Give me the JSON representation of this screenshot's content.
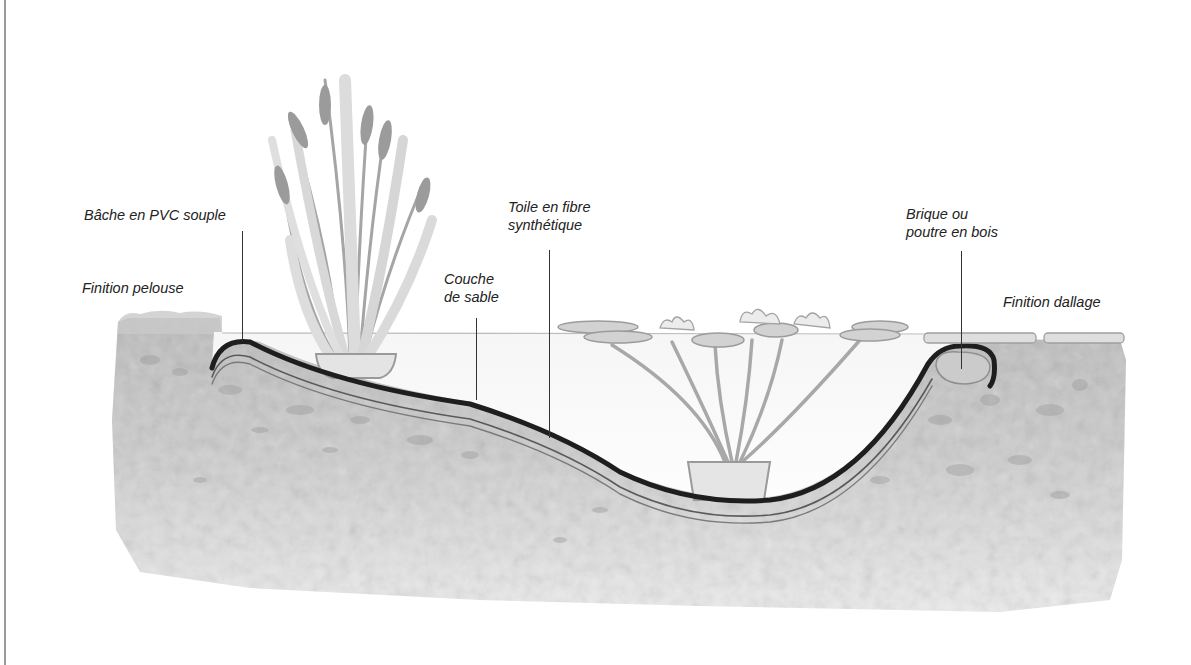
{
  "diagram": {
    "type": "cross-section illustration",
    "labels": [
      {
        "id": "bache",
        "lines": [
          "Bâche en PVC souple"
        ]
      },
      {
        "id": "pelouse",
        "lines": [
          "Finition pelouse"
        ]
      },
      {
        "id": "sable",
        "lines": [
          "Couche",
          "de sable"
        ]
      },
      {
        "id": "toile",
        "lines": [
          "Toile en fibre",
          "synthétique"
        ]
      },
      {
        "id": "brique",
        "lines": [
          "Brique ou",
          "poutre en bois"
        ]
      },
      {
        "id": "dallage",
        "lines": [
          "Finition dallage"
        ]
      }
    ],
    "elements": [
      "cattail-plant-in-pot",
      "water-lily-plant-in-pot",
      "lily-pads",
      "paving-slabs",
      "grass-edge",
      "soil-cross-section",
      "pond-liner-layers",
      "edge-brick"
    ],
    "colors": {
      "liner": "#1e1e1e",
      "soil": "#cfcfcf",
      "soil_dark": "#a9a9a9",
      "plant": "#9a9a9a",
      "water_line": "#bdbdbd",
      "text": "#222222"
    }
  }
}
